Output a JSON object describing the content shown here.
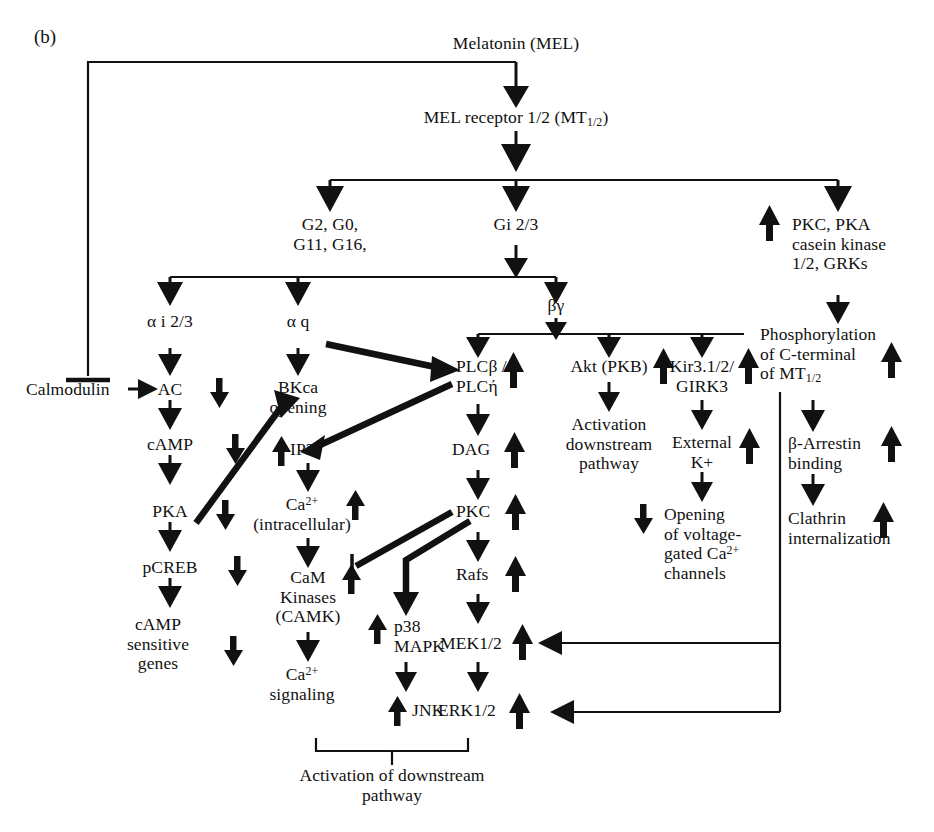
{
  "figure": {
    "panel_label": "(b)",
    "caption_brace": "Activation of downstream\npathway"
  },
  "nodes": {
    "melatonin": "Melatonin (MEL)",
    "mel_receptor": "MEL receptor 1/2 (MT1/2)",
    "g_family": "G2, G0,\nG11, G16,",
    "gi23": "Gi 2/3",
    "kinases": "PKC, PKA\ncasein kinase\n1/2, GRKs",
    "alpha_i": "α i 2/3",
    "alpha_q": "α q",
    "beta_gamma": "βγ",
    "phosphorylation": "Phosphorylation\nof C-terminal\nof MT1/2",
    "calmodulin": "Calmodulin",
    "ac": "AC",
    "bkca": "BKca\nopening",
    "plc": "PLCβ /\nPLCή",
    "akt": "Akt (PKB)",
    "kir": "Kir3.1/2/\nGIRK3",
    "camp": "cAMP",
    "ip3": "IP3",
    "dag": "DAG",
    "akt_down": "Activation\ndownstream\npathway",
    "ext_k": "External\nK+",
    "beta_arrestin": "β-Arrestin\nbinding",
    "pka": "PKA",
    "ca_intra": "Ca2+\n(intracellular)",
    "pkc": "PKC",
    "voltage_ca": "Opening\nof voltage-\ngated Ca2+\nchannels",
    "clathrin": "Clathrin\ninternalization",
    "pcreb": "pCREB",
    "cam_kinases": "CaM\nKinases\n(CAMK)",
    "rafs": "Rafs",
    "p38": "p38\nMAPK",
    "camp_genes": "cAMP\nsensitive\ngenes",
    "mek": "MEK1/2",
    "ca_signaling": "Ca2+\nsignaling",
    "jnk": "JNK",
    "erk": "ERK1/2",
    "activation_downstream": "Activation of downstream\npathway"
  },
  "regulation": {
    "ac": "down",
    "camp": "down",
    "pka": "down",
    "pcreb": "down",
    "camp_genes": "down",
    "ip3": "up",
    "ca_intra": "up",
    "cam": "up",
    "p38": "up",
    "jnk": "up",
    "plc": "up",
    "dag": "up",
    "pkc": "up",
    "rafs": "up",
    "mek": "up",
    "erk": "up",
    "kinases": "up",
    "akt": "up",
    "kir": "up",
    "phosphorylation": "up",
    "ext_k": "up",
    "beta_arrestin": "up",
    "voltage_ca": "down",
    "clathrin": "up"
  },
  "colors": {
    "ink": "#111111",
    "background": "#ffffff"
  }
}
